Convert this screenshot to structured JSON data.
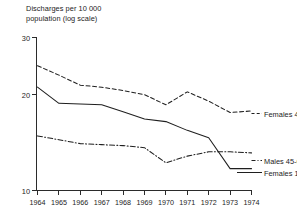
{
  "chart_data": {
    "type": "line",
    "title_line1": "Discharges per 10 000",
    "title_line2": "population (log scale)",
    "xlabel": "",
    "ylabel": "Discharges per 10 000 population (log scale)",
    "yscale": "log",
    "ylim": [
      10,
      30
    ],
    "yticks": [
      10,
      20,
      30
    ],
    "ytick_labels": [
      "10",
      "20",
      "30"
    ],
    "grid": false,
    "legend_position": "right-inline",
    "categories": [
      1964,
      1965,
      1966,
      1967,
      1968,
      1969,
      1970,
      1971,
      1972,
      1973,
      1974
    ],
    "xtick_labels": [
      "1964",
      "1965",
      "1966",
      "1967",
      "1968",
      "1969",
      "1970",
      "1971",
      "1972",
      "1973",
      "1974"
    ],
    "series": [
      {
        "name": "Females 45-64",
        "style": "dashed",
        "label": "Females 45-64",
        "values": [
          24.5,
          22.9,
          21.3,
          21.0,
          20.5,
          19.9,
          18.5,
          20.3,
          19.0,
          17.5,
          17.7
        ]
      },
      {
        "name": "Females 15-44",
        "style": "solid",
        "label": "Females 15-44",
        "values": [
          21.0,
          18.7,
          18.6,
          18.5,
          17.6,
          16.7,
          16.4,
          15.4,
          14.6,
          11.7,
          11.7
        ]
      },
      {
        "name": "Males 45-64",
        "style": "dash-dot",
        "label": "Males 45-64",
        "values": [
          14.8,
          14.4,
          14.0,
          13.9,
          13.8,
          13.6,
          12.2,
          12.8,
          13.2,
          13.2,
          13.1
        ]
      }
    ]
  },
  "colors": {
    "ink": "#1f1f1f",
    "axis": "#2b2b2b",
    "background": "#ffffff"
  }
}
